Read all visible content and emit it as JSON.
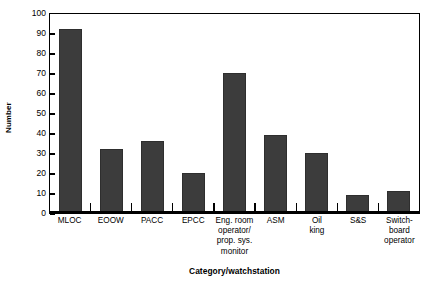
{
  "chart_data": {
    "type": "bar",
    "title": "",
    "xlabel": "Category/watchstation",
    "ylabel": "Number",
    "ylim": [
      0,
      100
    ],
    "ytick_step": 10,
    "yticks": [
      0,
      10,
      20,
      30,
      40,
      50,
      60,
      70,
      80,
      90,
      100
    ],
    "ytick_labels": [
      "0",
      "10",
      "20",
      "30",
      "40",
      "50",
      "60",
      "70",
      "80",
      "90",
      "100"
    ],
    "grid": false,
    "legend": null,
    "bar_color": "#3c3c3c",
    "axis_color": "#000000",
    "background": "#ffffff",
    "categories": [
      "MLOC",
      "EOOW",
      "PACC",
      "EPCC",
      "Eng. room\noperator/\nprop. sys.\nmonitor",
      "ASM",
      "Oil\nking",
      "S&S",
      "Switch-\nboard\noperator"
    ],
    "values": [
      92,
      32,
      36,
      20,
      70,
      39,
      30,
      9,
      11
    ]
  }
}
